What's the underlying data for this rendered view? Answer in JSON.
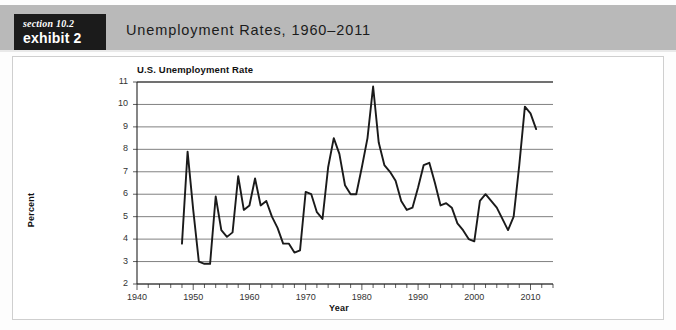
{
  "header": {
    "badge_section": "section 10.2",
    "badge_exhibit": "exhibit 2",
    "title": "Unemployment Rates, 1960–2011",
    "band_color": "#b9b9b9",
    "badge_bg": "#1b1b1b"
  },
  "chart_data": {
    "type": "line",
    "title": "U.S. Unemployment Rate",
    "xlabel": "Year",
    "ylabel": "Percent",
    "xlim": [
      1940,
      2014
    ],
    "ylim": [
      2,
      11
    ],
    "ytick_labels": [
      "2",
      "3",
      "4",
      "5",
      "6",
      "7",
      "8",
      "9",
      "10",
      "11"
    ],
    "ytick_values": [
      2,
      3,
      4,
      5,
      6,
      7,
      8,
      9,
      10,
      11
    ],
    "xtick_labels": [
      "1940",
      "1950",
      "1960",
      "1970",
      "1980",
      "1990",
      "2000",
      "2010"
    ],
    "xtick_values": [
      1940,
      1950,
      1960,
      1970,
      1980,
      1990,
      2000,
      2010
    ],
    "minor_tick_interval": 2,
    "grid": "horizontal",
    "legend": "none",
    "line_color": "#1a1a1a",
    "series_name": "U.S. Unemployment Rate",
    "x": [
      1948,
      1949,
      1950,
      1951,
      1952,
      1953,
      1954,
      1955,
      1956,
      1957,
      1958,
      1959,
      1960,
      1961,
      1962,
      1963,
      1964,
      1965,
      1966,
      1967,
      1968,
      1969,
      1970,
      1971,
      1972,
      1973,
      1974,
      1975,
      1976,
      1977,
      1978,
      1979,
      1980,
      1981,
      1982,
      1983,
      1984,
      1985,
      1986,
      1987,
      1988,
      1989,
      1990,
      1991,
      1992,
      1993,
      1994,
      1995,
      1996,
      1997,
      1998,
      1999,
      2000,
      2001,
      2002,
      2003,
      2004,
      2005,
      2006,
      2007,
      2008,
      2009,
      2010,
      2011
    ],
    "values": [
      3.8,
      7.9,
      5.3,
      3.0,
      2.9,
      2.9,
      5.9,
      4.4,
      4.1,
      4.3,
      6.8,
      5.3,
      5.5,
      6.7,
      5.5,
      5.7,
      5.0,
      4.5,
      3.8,
      3.8,
      3.4,
      3.5,
      6.1,
      6.0,
      5.2,
      4.9,
      7.2,
      8.5,
      7.8,
      6.4,
      6.0,
      6.0,
      7.2,
      8.5,
      10.8,
      8.3,
      7.3,
      7.0,
      6.6,
      5.7,
      5.3,
      5.4,
      6.3,
      7.3,
      7.4,
      6.5,
      5.5,
      5.6,
      5.4,
      4.7,
      4.4,
      4.0,
      3.9,
      5.7,
      6.0,
      5.7,
      5.4,
      4.9,
      4.4,
      5.0,
      7.3,
      9.9,
      9.6,
      8.9
    ],
    "units": "percent"
  }
}
